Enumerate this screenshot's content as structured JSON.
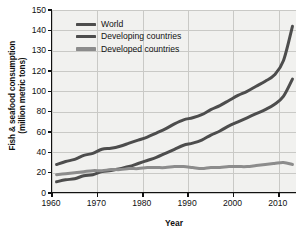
{
  "chart_data": {
    "type": "line",
    "title": "",
    "xlabel": "Year",
    "ylabel_line1": "Fish & seafood consumption",
    "ylabel_line2": "(million metric tons)",
    "xlim": [
      1960,
      2014
    ],
    "xticks": [
      1960,
      1970,
      1980,
      1990,
      2000,
      2010
    ],
    "yticks": [
      0,
      20,
      40,
      60,
      80,
      100,
      120,
      130,
      140,
      150
    ],
    "y_axis_note": "broken / compressed above 100",
    "ylim": [
      0,
      150
    ],
    "grid": true,
    "legend_position": "top-left inside plot",
    "colors": {
      "world": "#4d4d4d",
      "developing": "#4d4d4d",
      "developed": "#8c8c8c",
      "plot_background": "#f1f1ef",
      "gridline": "#c9c9c6",
      "axis": "#111111"
    },
    "series": [
      {
        "name": "World",
        "color": "#4d4d4d",
        "x": [
          1961,
          1963,
          1965,
          1967,
          1969,
          1971,
          1973,
          1975,
          1977,
          1979,
          1981,
          1983,
          1985,
          1987,
          1989,
          1991,
          1993,
          1995,
          1997,
          1999,
          2001,
          2003,
          2005,
          2007,
          2009,
          2011,
          2013
        ],
        "values": [
          28,
          31,
          33,
          37,
          39,
          43,
          44,
          46,
          49,
          52,
          55,
          59,
          63,
          68,
          72,
          74,
          77,
          82,
          86,
          91,
          96,
          100,
          105,
          110,
          116,
          125,
          142
        ]
      },
      {
        "name": "Developing countries",
        "color": "#4d4d4d",
        "x": [
          1961,
          1963,
          1965,
          1967,
          1969,
          1971,
          1973,
          1975,
          1977,
          1979,
          1981,
          1983,
          1985,
          1987,
          1989,
          1991,
          1993,
          1995,
          1997,
          1999,
          2001,
          2003,
          2005,
          2007,
          2009,
          2011,
          2013
        ],
        "values": [
          11,
          13,
          14,
          17,
          18,
          21,
          22,
          24,
          26,
          29,
          32,
          35,
          39,
          43,
          47,
          49,
          52,
          57,
          61,
          66,
          70,
          74,
          78,
          82,
          87,
          95,
          112
        ]
      },
      {
        "name": "Developed countries",
        "color": "#8c8c8c",
        "x": [
          1961,
          1963,
          1965,
          1967,
          1969,
          1971,
          1973,
          1975,
          1977,
          1979,
          1981,
          1983,
          1985,
          1987,
          1989,
          1991,
          1993,
          1995,
          1997,
          1999,
          2001,
          2003,
          2005,
          2007,
          2009,
          2011,
          2013
        ],
        "values": [
          18,
          19,
          20,
          21,
          22,
          22,
          23,
          23,
          24,
          24,
          25,
          25,
          25,
          26,
          26,
          25,
          24,
          25,
          25,
          26,
          26,
          26,
          27,
          28,
          29,
          30,
          28
        ]
      }
    ]
  },
  "legend": {
    "items": [
      {
        "label": "World"
      },
      {
        "label": "Developing countries"
      },
      {
        "label": "Developed countries"
      }
    ]
  }
}
